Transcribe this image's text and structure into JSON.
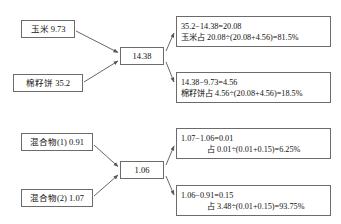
{
  "diagram": {
    "type": "cross-multiplication-pearson-square",
    "groups": [
      {
        "id": "group-top",
        "inputs": [
          {
            "label": "玉米 9.73"
          },
          {
            "label": "棉籽饼 35.2"
          }
        ],
        "center": {
          "label": "14.38"
        },
        "results": [
          {
            "line1": "35.2−14.38=20.08",
            "line2": "玉米占 20.08÷(20.08+4.56)=81.5%"
          },
          {
            "line1": "14.38−9.73=4.56",
            "line2": "棉籽饼占 4.56÷(20.08+4.56)=18.5%"
          }
        ]
      },
      {
        "id": "group-bottom",
        "inputs": [
          {
            "label": "混合物(1) 0.91"
          },
          {
            "label": "混合物(2) 1.07"
          }
        ],
        "center": {
          "label": "1.06"
        },
        "results": [
          {
            "line1": "1.07−1.06=0.01",
            "line2": "占 0.01÷(0.01+0.15)=6.25%"
          },
          {
            "line1": "1.06−0.91=0.15",
            "line2": "占 3.48÷(0.01+0.15)=93.75%"
          }
        ]
      }
    ],
    "colors": {
      "border": "#6b6b6b",
      "arrow": "#555555",
      "text": "#111111",
      "background": "#ffffff"
    }
  }
}
